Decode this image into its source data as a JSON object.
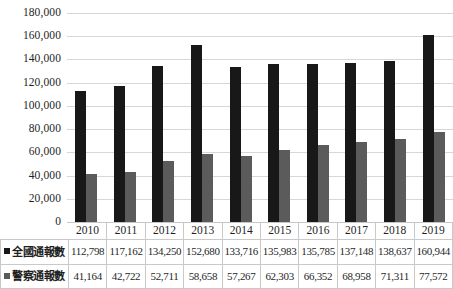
{
  "chart_data": {
    "type": "bar",
    "title": "",
    "xlabel": "",
    "ylabel": "",
    "grid": true,
    "legend_position": "table-left",
    "ylim": [
      0,
      180000
    ],
    "ytick_values": [
      180000,
      160000,
      140000,
      120000,
      100000,
      80000,
      60000,
      40000,
      20000,
      0
    ],
    "ytick_labels": [
      "180,000",
      "160,000",
      "140,000",
      "120,000",
      "100,000",
      "80,000",
      "60,000",
      "40,000",
      "20,000",
      "0"
    ],
    "categories": [
      "2010",
      "2011",
      "2012",
      "2013",
      "2014",
      "2015",
      "2016",
      "2017",
      "2018",
      "2019"
    ],
    "series": [
      {
        "name": "全國通報數",
        "color": "#181818",
        "values": [
          112798,
          117162,
          134250,
          152680,
          133716,
          135983,
          135785,
          137148,
          138637,
          160944
        ],
        "labels": [
          "112,798",
          "117,162",
          "134,250",
          "152,680",
          "133,716",
          "135,983",
          "135,785",
          "137,148",
          "138,637",
          "160,944"
        ]
      },
      {
        "name": "警察通報數",
        "color": "#5b5b5b",
        "values": [
          41164,
          42722,
          52711,
          58658,
          57267,
          62303,
          66352,
          68958,
          71311,
          77572
        ],
        "labels": [
          "41,164",
          "42,722",
          "52,711",
          "58,658",
          "57,267",
          "62,303",
          "66,352",
          "68,958",
          "71,311",
          "77,572"
        ]
      }
    ]
  }
}
